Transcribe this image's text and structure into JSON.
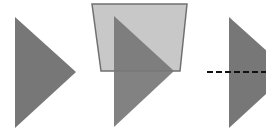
{
  "figure": {
    "colors": {
      "triangle_fill": "#777777",
      "trapezoid_fill": "#c8c8c8",
      "trapezoid_stroke": "#707070",
      "dashed_line": "#111111",
      "background": "#ffffff"
    },
    "panels": [
      {
        "id": "plain-triangle"
      },
      {
        "id": "triangle-with-trapezoid"
      },
      {
        "id": "triangle-with-dashed-line"
      }
    ]
  }
}
